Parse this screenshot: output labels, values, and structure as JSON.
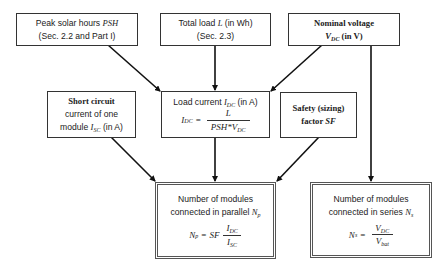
{
  "diagram": {
    "boxes": {
      "psh": {
        "line1_prefix": "Peak solar hours ",
        "line1_var": "PSH",
        "line2": "(Sec. 2.2 and Part I)"
      },
      "load": {
        "line1_prefix": "Total load ",
        "line1_var": "L",
        "line1_suffix": " (in Wh)",
        "line2": "(Sec. 2.3)"
      },
      "voltage": {
        "line1": "Nominal voltage",
        "line2_var": "V",
        "line2_sub": "DC",
        "line2_suffix": " (in V)"
      },
      "short_circuit": {
        "line1": "Short circuit",
        "line2": "current of one",
        "line3_prefix": "module ",
        "line3_var": "I",
        "line3_sub": "SC",
        "line3_suffix": " (in A)"
      },
      "load_current": {
        "title_prefix": "Load current ",
        "title_var": "I",
        "title_sub": "DC",
        "title_suffix": " (in A)",
        "lhs_var": "I",
        "lhs_sub": "DC",
        "eq": "=",
        "num": "L",
        "den_prefix": "PSH*V",
        "den_sub": "DC"
      },
      "safety": {
        "line1": "Safety (sizing)",
        "line2_prefix": "factor ",
        "line2_var": "SF"
      },
      "parallel": {
        "line1": "Number of modules",
        "line2_prefix": "connected in parallel ",
        "line2_var": "N",
        "line2_sub": "p",
        "lhs_var": "N",
        "lhs_sub": "p",
        "eq": "=",
        "factor": "SF",
        "num_var": "I",
        "num_sub": "DC",
        "den_var": "I",
        "den_sub": "SC"
      },
      "series": {
        "line1": "Number of modules",
        "line2_prefix": "connected in series ",
        "line2_var": "N",
        "line2_sub": "s",
        "lhs_var": "N",
        "lhs_sub": "s",
        "eq": "=",
        "num_var": "V",
        "num_sub": "DC",
        "den_var": "V",
        "den_sub": "bat"
      }
    },
    "edges": [
      {
        "from": "psh",
        "to": "load_current"
      },
      {
        "from": "load",
        "to": "load_current"
      },
      {
        "from": "voltage",
        "to": "load_current"
      },
      {
        "from": "voltage",
        "to": "series"
      },
      {
        "from": "short_circuit",
        "to": "parallel"
      },
      {
        "from": "load_current",
        "to": "parallel"
      },
      {
        "from": "safety",
        "to": "parallel"
      }
    ]
  }
}
